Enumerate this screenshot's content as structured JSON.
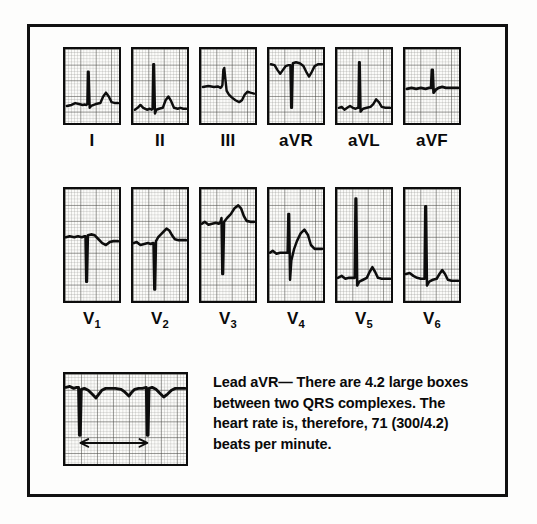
{
  "figure": {
    "type": "12-lead-ecg-with-rhythm-strip",
    "background_color": "#fdfdfc",
    "ink_color": "#0d0d0d",
    "border_color": "#111111"
  },
  "limb_leads": [
    {
      "label": "I",
      "name": "lead-i",
      "morphology": "small upright P, tall narrow R spike, rounded T wave, baseline low"
    },
    {
      "label": "II",
      "name": "lead-ii",
      "morphology": "tall narrow R spike with upright P and rounded T wave"
    },
    {
      "label": "III",
      "name": "lead-iii",
      "morphology": "small R then broad negative/biphasic deflection, downsloping ST"
    },
    {
      "label": "aVR",
      "name": "lead-avr",
      "morphology": "high baseline, deep narrow negative QRS, inverted T waves"
    },
    {
      "label": "aVL",
      "name": "lead-avl",
      "morphology": "very tall narrow R spike from low baseline, small T wave"
    },
    {
      "label": "aVF",
      "name": "lead-avf",
      "morphology": "flat thick baseline with modest narrow R spike and small T"
    }
  ],
  "precordial_leads": [
    {
      "label": "V",
      "subscript": "1",
      "name": "lead-v1",
      "morphology": "high baseline, deep narrow S wave, shallow negative T"
    },
    {
      "label": "V",
      "subscript": "2",
      "name": "lead-v2",
      "morphology": "very deep S wave, rising ST into peaked T wave"
    },
    {
      "label": "V",
      "subscript": "3",
      "name": "lead-v3",
      "morphology": "deep S wave with tall rounded T wave"
    },
    {
      "label": "V",
      "subscript": "4",
      "name": "lead-v4",
      "morphology": "tall R, deep S, prominent rounded T wave"
    },
    {
      "label": "V",
      "subscript": "5",
      "name": "lead-v5",
      "morphology": "very tall narrow R spike, low baseline, rounded T wave"
    },
    {
      "label": "V",
      "subscript": "6",
      "name": "lead-v6",
      "morphology": "tall narrow R spike with small rounded T wave"
    }
  ],
  "rhythm_strip": {
    "name": "rhythm-strip-avr",
    "lead": "aVR",
    "morphology": "two deep negative QRS complexes with inverted T waves between them",
    "measurement": {
      "name": "rr-interval-arrow",
      "style": "double-headed-arrow",
      "spans": "between two QRS complexes",
      "large_boxes": "4.2"
    }
  },
  "caption": {
    "lines": [
      "Lead aVR— There are 4.2 large boxes",
      "between two QRS complexes. The",
      "heart rate is, therefore, 71 (300/4.2)",
      "beats per minute."
    ],
    "full_text": "Lead aVR— There are 4.2 large boxes between two QRS complexes. The heart rate is, therefore, 71 (300/4.2) beats per minute.",
    "values": {
      "large_boxes": "4.2",
      "heart_rate": "71",
      "formula": "300/4.2",
      "units": "beats per minute"
    }
  }
}
